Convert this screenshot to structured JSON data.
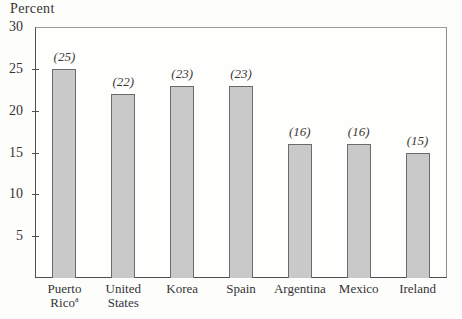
{
  "chart_data": {
    "type": "bar",
    "title": "",
    "ylabel": "Percent",
    "xlabel": "",
    "ylim": [
      0,
      30
    ],
    "yticks": [
      30,
      25,
      20,
      15,
      10,
      5
    ],
    "grid": false,
    "legend": null,
    "categories": [
      "Puerto Rico",
      "United States",
      "Korea",
      "Spain",
      "Argentina",
      "Mexico",
      "Ireland"
    ],
    "category_display": [
      {
        "lines": [
          "Puerto",
          "Rico"
        ],
        "superscript": "a"
      },
      {
        "lines": [
          "United",
          "States"
        ],
        "superscript": ""
      },
      {
        "lines": [
          "Korea"
        ],
        "superscript": ""
      },
      {
        "lines": [
          "Spain"
        ],
        "superscript": ""
      },
      {
        "lines": [
          "Argentina"
        ],
        "superscript": ""
      },
      {
        "lines": [
          "Mexico"
        ],
        "superscript": ""
      },
      {
        "lines": [
          "Ireland"
        ],
        "superscript": ""
      }
    ],
    "values": [
      25,
      22,
      23,
      23,
      16,
      16,
      15
    ],
    "value_labels": [
      "(25)",
      "(22)",
      "(23)",
      "(23)",
      "(16)",
      "(16)",
      "(15)"
    ],
    "colors": {
      "bar_fill": "#c9c9c9",
      "bar_border": "#6b6b6b",
      "axis_dark": "#4f4f4f",
      "axis_light": "#9c9c9c",
      "text": "#343434",
      "background": "#fdfdfc"
    }
  }
}
